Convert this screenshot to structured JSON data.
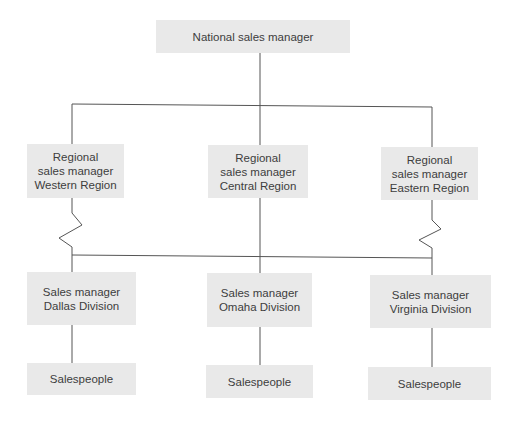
{
  "diagram": {
    "type": "organization-chart",
    "colors": {
      "box_fill": "#e9e9e9",
      "line": "#555555",
      "text": "#3d3d3d",
      "background": "#ffffff"
    },
    "nodes": {
      "national": {
        "label": "National sales manager"
      },
      "western": {
        "label": "Regional\nsales manager\nWestern Region"
      },
      "central": {
        "label": "Regional\nsales manager\nCentral Region"
      },
      "eastern": {
        "label": "Regional\nsales manager\nEastern Region"
      },
      "dallas": {
        "label": "Sales manager\nDallas Division"
      },
      "omaha": {
        "label": "Sales manager\nOmaha Division"
      },
      "virginia": {
        "label": "Sales manager\nVirginia Division"
      },
      "salespeople_dallas": {
        "label": "Salespeople"
      },
      "salespeople_omaha": {
        "label": "Salespeople"
      },
      "salespeople_virginia": {
        "label": "Salespeople"
      }
    },
    "edges": [
      {
        "from": "national",
        "to": "western",
        "style": "solid"
      },
      {
        "from": "national",
        "to": "central",
        "style": "solid"
      },
      {
        "from": "national",
        "to": "eastern",
        "style": "solid"
      },
      {
        "from": "western",
        "to": "division-bus",
        "style": "zigzag"
      },
      {
        "from": "central",
        "to": "division-bus",
        "style": "solid"
      },
      {
        "from": "eastern",
        "to": "division-bus",
        "style": "zigzag"
      },
      {
        "from": "division-bus",
        "to": "dallas",
        "style": "solid"
      },
      {
        "from": "division-bus",
        "to": "omaha",
        "style": "solid"
      },
      {
        "from": "division-bus",
        "to": "virginia",
        "style": "solid"
      },
      {
        "from": "dallas",
        "to": "salespeople_dallas",
        "style": "solid"
      },
      {
        "from": "omaha",
        "to": "salespeople_omaha",
        "style": "solid"
      },
      {
        "from": "virginia",
        "to": "salespeople_virginia",
        "style": "solid"
      }
    ]
  }
}
